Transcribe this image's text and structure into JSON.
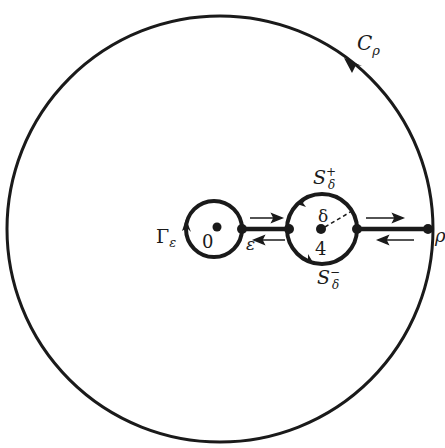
{
  "diagram": {
    "type": "contour-integration-keyhole",
    "colors": {
      "stroke": "#1a1a1a",
      "background": "#ffffff"
    },
    "outer_circle": {
      "label": "C",
      "label_sub": "ρ",
      "orientation": "counterclockwise"
    },
    "small_circle": {
      "label": "Γ",
      "label_sub": "ε",
      "center_label": "0",
      "orientation": "clockwise"
    },
    "indent_circle": {
      "upper_label": "S",
      "upper_sub": "δ",
      "upper_sup": "+",
      "lower_label": "S",
      "lower_sub": "δ",
      "lower_sup": "−",
      "center_label": "4",
      "radius_label": "δ"
    },
    "points": {
      "epsilon_label": "ε",
      "rho_label": "ρ"
    },
    "arrows": {
      "upper_direction": "right",
      "lower_direction": "left"
    }
  }
}
